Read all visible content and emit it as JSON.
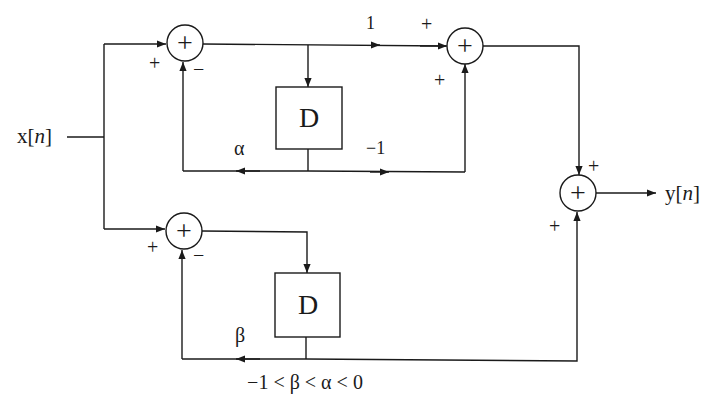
{
  "diagram": {
    "input_label": "x[",
    "input_var": "n",
    "input_close": "]",
    "output_label": "y[",
    "output_var": "n",
    "output_close": "]",
    "delay_label": "D",
    "sum_symbol": "+",
    "signs": {
      "top_sum_in": "+",
      "top_sum_fb": "−",
      "bot_sum_in": "+",
      "bot_sum_fb": "−",
      "right_sum_top": "+",
      "right_sum_bottom": "+",
      "out_sum_top": "+",
      "out_sum_bottom": "+"
    },
    "gains": {
      "forward_one": "1",
      "alpha": "α",
      "minus_one": "−1",
      "beta": "β"
    },
    "constraint": "−1 < β < α < 0",
    "colors": {
      "stroke": "#1a1a1a",
      "background": "#ffffff"
    }
  }
}
